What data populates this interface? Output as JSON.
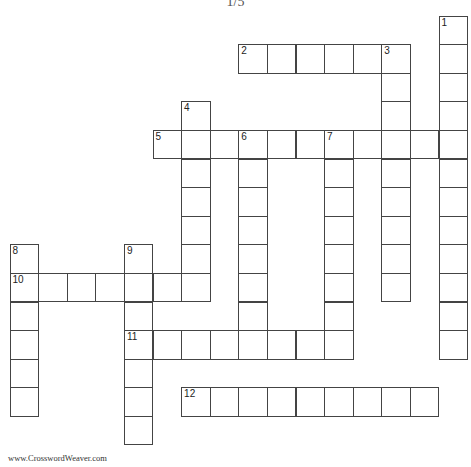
{
  "title": "1/5",
  "footer": "www.CrosswordWeaver.com",
  "grid": {
    "origin_x": 9.5,
    "origin_y": 15.5,
    "cell_size": 28.6,
    "line_color": "#444444"
  },
  "words": [
    {
      "number": "1",
      "direction": "down",
      "row": 0,
      "col": 15,
      "length": 12
    },
    {
      "number": "2",
      "direction": "across",
      "row": 1,
      "col": 8,
      "length": 6
    },
    {
      "number": "3",
      "direction": "down",
      "row": 1,
      "col": 13,
      "length": 9
    },
    {
      "number": "4",
      "direction": "down",
      "row": 3,
      "col": 6,
      "length": 6
    },
    {
      "number": "5",
      "direction": "across",
      "row": 4,
      "col": 5,
      "length": 11
    },
    {
      "number": "6",
      "direction": "down",
      "row": 4,
      "col": 8,
      "length": 7
    },
    {
      "number": "7",
      "direction": "down",
      "row": 4,
      "col": 11,
      "length": 8
    },
    {
      "number": "8",
      "direction": "down",
      "row": 8,
      "col": 0,
      "length": 6
    },
    {
      "number": "9",
      "direction": "down",
      "row": 8,
      "col": 4,
      "length": 7
    },
    {
      "number": "10",
      "direction": "across",
      "row": 9,
      "col": 0,
      "length": 7
    },
    {
      "number": "11",
      "direction": "across",
      "row": 11,
      "col": 4,
      "length": 7
    },
    {
      "number": "12",
      "direction": "across",
      "row": 13,
      "col": 6,
      "length": 9
    }
  ]
}
